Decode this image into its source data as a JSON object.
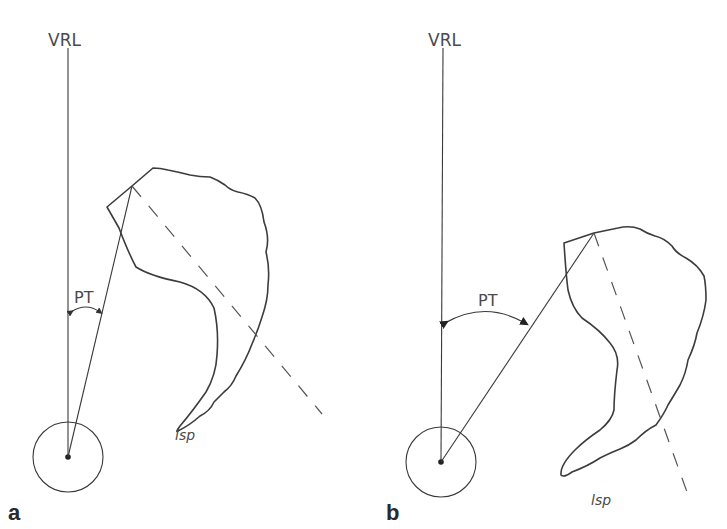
{
  "figure": {
    "colors": {
      "line": "#3a3a3a",
      "text": "#4a4a4a",
      "background": "#ffffff"
    },
    "panels": [
      {
        "id": "a",
        "panel_label": "a",
        "vertical_line_label": "VRL",
        "angle_label": "PT",
        "sacral_label": "lsp",
        "description": "Small pelvic tilt"
      },
      {
        "id": "b",
        "panel_label": "b",
        "vertical_line_label": "VRL",
        "angle_label": "PT",
        "sacral_label": "lsp",
        "description": "Large pelvic tilt"
      }
    ]
  }
}
